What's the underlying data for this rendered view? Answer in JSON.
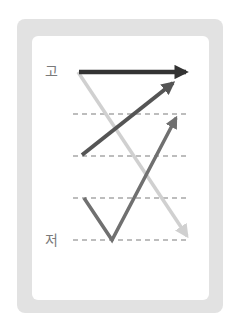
{
  "diagram": {
    "labels": {
      "high": "고",
      "low": "저"
    },
    "levels_y": [
      72,
      114,
      156,
      198,
      240
    ],
    "dashed_levels": [
      114,
      156,
      198,
      240
    ],
    "colors": {
      "frame": "#e2e2e2",
      "panel": "#ffffff",
      "dash": "#a8a8a8",
      "level_flat_high": "#333333",
      "rising": "#555555",
      "fall_rise": "#707070",
      "falling": "#d0d0d0",
      "label": "#7a7a7a"
    },
    "contours": [
      {
        "name": "level-high",
        "description": "flat high",
        "from": [
          79,
          72
        ],
        "to": [
          192,
          72
        ]
      },
      {
        "name": "rising",
        "description": "rising",
        "from": [
          82,
          155
        ],
        "to": [
          176,
          80
        ]
      },
      {
        "name": "fall-rise",
        "description": "falling then rising",
        "points": [
          [
            84,
            198
          ],
          [
            112,
            240
          ],
          [
            178,
            114
          ]
        ]
      },
      {
        "name": "falling",
        "description": "high to low falling",
        "from": [
          78,
          72
        ],
        "to": [
          189,
          239
        ]
      }
    ]
  }
}
